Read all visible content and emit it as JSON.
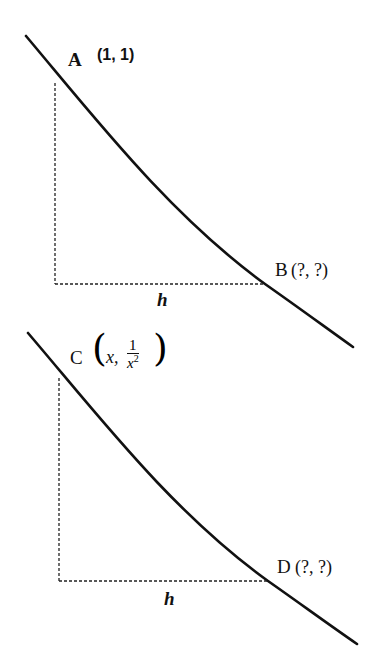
{
  "diagram": {
    "type": "curve-secant-figure",
    "panels": [
      {
        "id": "top",
        "point_start": {
          "letter": "A",
          "coords": "(1, 1)"
        },
        "point_end": {
          "letter": "B",
          "coords": "(?, ?)"
        },
        "width_label": "h"
      },
      {
        "id": "bottom",
        "point_start": {
          "letter": "C",
          "x_label": "x,",
          "frac_num": "1",
          "frac_den": "x",
          "frac_exp": "2",
          "paren_open": "(",
          "paren_close": ")"
        },
        "point_end": {
          "letter": "D",
          "coords": "(?, ?)"
        },
        "width_label": "h"
      }
    ],
    "colors": {
      "curve": "#111111",
      "dashed": "#222222",
      "background": "#ffffff"
    }
  }
}
